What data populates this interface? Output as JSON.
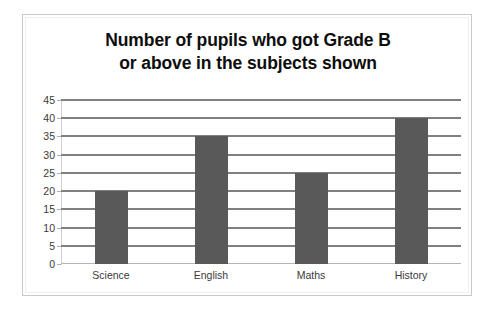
{
  "chart_data": {
    "type": "bar",
    "title": "Number of pupils who got Grade B or above in the subjects shown",
    "title_lines": [
      "Number of pupils who got Grade B",
      "or above in the subjects shown"
    ],
    "categories": [
      "Science",
      "English",
      "Maths",
      "History"
    ],
    "values": [
      20,
      35,
      25,
      40
    ],
    "xlabel": "",
    "ylabel": "",
    "ylim": [
      0,
      45
    ],
    "ytick_step": 5,
    "yticks": [
      0,
      5,
      10,
      15,
      20,
      25,
      30,
      35,
      40,
      45
    ],
    "ytick_labels": [
      "0",
      "5",
      "10",
      "15",
      "20",
      "25",
      "30",
      "35",
      "40",
      "45"
    ],
    "grid": true,
    "grid_axis": "y",
    "legend": false,
    "legend_position": "none",
    "series": [
      {
        "name": "Pupils",
        "values": [
          20,
          35,
          25,
          40
        ],
        "color": "#595959"
      }
    ],
    "colors": {
      "bar": "#595959",
      "gridline": "#808080",
      "axis": "#d0d0d0",
      "border": "#c9c9c9",
      "title_text": "#0d0d0d",
      "tick_text": "#3a3a3a",
      "background": "#ffffff"
    }
  }
}
